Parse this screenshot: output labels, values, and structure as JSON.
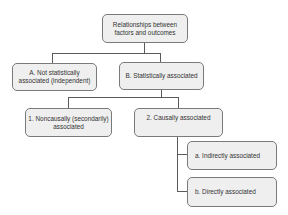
{
  "diagram": {
    "type": "tree",
    "root": {
      "label": "Relationships between\nfactors and outcomes"
    },
    "level1": [
      {
        "id": "A",
        "label": "A. Not statistically\nassociated (independent)"
      },
      {
        "id": "B",
        "label": "B. Statistically associated"
      }
    ],
    "level2": [
      {
        "id": "1",
        "parent": "B",
        "label": "1. Noncausally (secondarily)\nassociated"
      },
      {
        "id": "2",
        "parent": "B",
        "label": "2. Causally associated"
      }
    ],
    "level3": [
      {
        "id": "a",
        "parent": "2",
        "label": "a. Indirectly associated"
      },
      {
        "id": "b",
        "parent": "2",
        "label": "b. Directly associated"
      }
    ],
    "colors": {
      "box_fill": "#efefef",
      "box_border": "#7a7a7a",
      "text": "#333333",
      "connector": "#5a5a5a"
    }
  }
}
